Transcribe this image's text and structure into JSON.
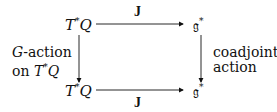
{
  "diagram": {
    "type": "commutative-diagram",
    "nodes": {
      "top_left": {
        "base": "T",
        "sup": "*",
        "rest": "Q"
      },
      "top_right": {
        "base": "𝔤",
        "sup": "*"
      },
      "bottom_left": {
        "base": "T",
        "sup": "*",
        "rest": "Q"
      },
      "bottom_right": {
        "base": "𝔤",
        "sup": "*"
      }
    },
    "edges": {
      "top": {
        "label": "J",
        "from": "T*Q",
        "to": "g*"
      },
      "bottom": {
        "label": "J",
        "from": "T*Q",
        "to": "g*"
      },
      "left": {
        "label_line1_var": "G",
        "label_line1_rest": "-action",
        "label_line2_prefix": "on ",
        "label_line2_base": "T",
        "label_line2_sup": "*",
        "label_line2_rest": "Q"
      },
      "right": {
        "label_line1": "coadjoint",
        "label_line2": "action"
      }
    }
  }
}
